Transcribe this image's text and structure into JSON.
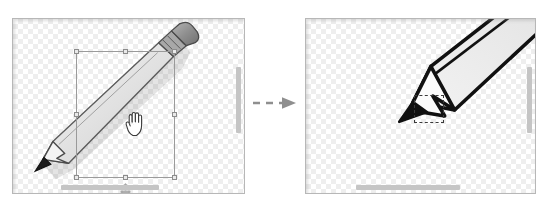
{
  "figure": {
    "kind": "before-after-diagram",
    "panel_count": 2,
    "transition_arrow": {
      "icon": "dashed-arrow-right-icon",
      "style": "dashed",
      "direction": "right",
      "color": "#8f8f8f"
    },
    "colors": {
      "canvas_background": "#ffffff",
      "checker_light": "#ffffff",
      "checker_dark": "#eeeeee",
      "panel_border": "#b7b7b7",
      "scrollbar_thumb": "#c5c5c5",
      "selection_border": "#9a9a9a",
      "handle_fill": "#e9e9e9",
      "handle_border": "#8c8c8c",
      "dashed_box": "#3a3a3a",
      "pencil_body": "#ebebeb",
      "pencil_outline_light": "#5d5d5d",
      "pencil_outline_bold": "#111111",
      "pencil_eraser": "#9a9a9a",
      "pencil_lead": "#1a1a1a"
    },
    "panels": [
      {
        "id": "panel-before",
        "name": "before-state",
        "label": "",
        "canvas": {
          "name": "transparent-checkerboard-canvas",
          "pattern": "checkerboard",
          "tile_px": 5
        },
        "artwork": {
          "name": "pencil-illustration",
          "label": "",
          "orientation": "diagonal-bottom-left-to-top-right",
          "state": "selected"
        },
        "selection": {
          "name": "selection-bounding-box",
          "label": "",
          "handles": [
            "top-left",
            "top-center",
            "top-right",
            "middle-left",
            "middle-right",
            "bottom-left",
            "bottom-center",
            "bottom-right"
          ],
          "handle_count": 8,
          "resize_hint_icon": "vertical-resize-icon"
        },
        "cursor": {
          "name": "grab-hand-cursor",
          "icon": "grab-hand-icon",
          "label": ""
        },
        "scrollbars": {
          "vertical": {
            "name": "vertical-scrollbar",
            "visible": true
          },
          "horizontal": {
            "name": "horizontal-scrollbar",
            "visible": true
          }
        }
      },
      {
        "id": "panel-after",
        "name": "after-state",
        "label": "",
        "canvas": {
          "name": "transparent-checkerboard-canvas",
          "pattern": "checkerboard",
          "tile_px": 5
        },
        "artwork": {
          "name": "pencil-illustration-zoomed",
          "label": "",
          "orientation": "diagonal-bottom-left-to-top-right",
          "state": "zoomed-in"
        },
        "target_marker": {
          "name": "dashed-target-box",
          "label": "",
          "style": "dashed"
        },
        "scrollbars": {
          "vertical": {
            "name": "vertical-scrollbar",
            "visible": true
          },
          "horizontal": {
            "name": "horizontal-scrollbar",
            "visible": true
          }
        }
      }
    ]
  }
}
